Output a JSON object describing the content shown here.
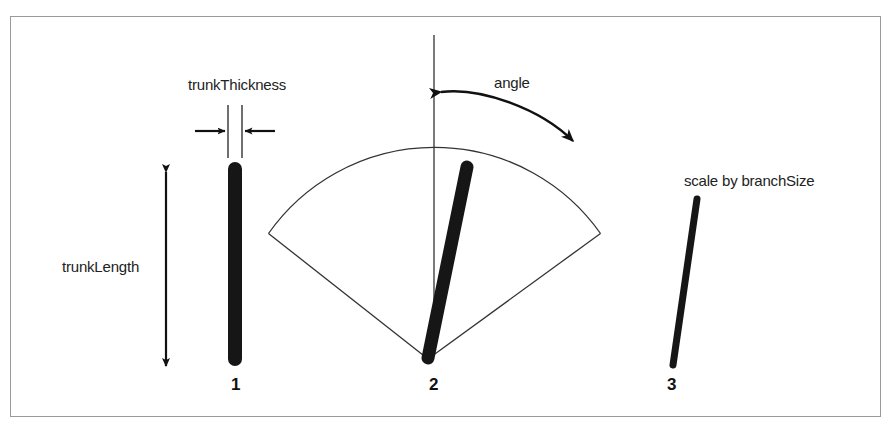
{
  "figure": {
    "background_color": "#ffffff",
    "frame_color": "#9a9a9a",
    "ink_color": "#111111",
    "thin_line_color": "#222222"
  },
  "labels": {
    "trunk_thickness": "trunkThickness",
    "trunk_length": "trunkLength",
    "angle": "angle",
    "branch_size": "scale by branchSize"
  },
  "panels": [
    {
      "number": "1",
      "caption_labels": [
        "trunkThickness",
        "trunkLength"
      ],
      "description": "vertical thick trunk with thickness callout above and length double-arrow at left"
    },
    {
      "number": "2",
      "caption_labels": [
        "angle"
      ],
      "description": "branch rotated from vertical reference line, with fan sector showing swing range and curved angle arrow"
    },
    {
      "number": "3",
      "caption_labels": [
        "scale by branchSize"
      ],
      "description": "thinner shorter branch scaled down by branchSize"
    }
  ],
  "geometry": {
    "trunk": {
      "x": 234,
      "top_y": 161,
      "bottom_y": 365,
      "thickness": 14
    },
    "thickness_guides": {
      "left_x": 227,
      "right_x": 241,
      "top_y": 104,
      "bottom_y": 157
    },
    "thickness_arrow_y": 130,
    "length_arrow": {
      "x": 165,
      "top_y": 168,
      "bottom_y": 366
    },
    "reference_line": {
      "x": 433,
      "top_y": 33,
      "bottom_y": 351
    },
    "fan": {
      "apex_x": 427,
      "apex_y": 357,
      "radius": 203,
      "half_angle_deg": 52
    },
    "branch2": {
      "x1": 427,
      "y1": 357,
      "x2": 466,
      "y2": 163,
      "thickness": 13
    },
    "branch3": {
      "x1": 672,
      "y1": 364,
      "x2": 696,
      "y2": 198,
      "thickness": 7
    },
    "angle_arc": {
      "start_x": 437,
      "start_y": 90,
      "end_x": 575,
      "end_y": 143
    }
  }
}
